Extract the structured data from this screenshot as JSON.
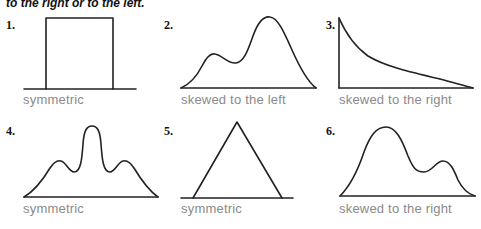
{
  "header": {
    "text": "to the right or to the left."
  },
  "panels": [
    {
      "number": "1.",
      "caption": "symmetric",
      "shape": "uniform-rectangle"
    },
    {
      "number": "2.",
      "caption": "skewed to the left",
      "shape": "bimodal-right-peak"
    },
    {
      "number": "3.",
      "caption": "skewed to the right",
      "shape": "decaying-curve"
    },
    {
      "number": "4.",
      "caption": "symmetric",
      "shape": "trimodal-center-peak"
    },
    {
      "number": "5.",
      "caption": "symmetric",
      "shape": "triangle"
    },
    {
      "number": "6.",
      "caption": "skewed to the right",
      "shape": "bimodal-left-peak"
    }
  ],
  "colors": {
    "line": "#222222",
    "caption": "#8a8a8a",
    "number": "#111111"
  }
}
